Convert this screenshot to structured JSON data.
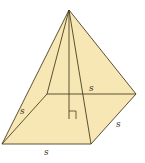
{
  "diagram": {
    "type": "square-pyramid",
    "colors": {
      "fill": "#f7e7b5",
      "stroke": "#4a3e22",
      "background": "#ffffff"
    },
    "vertices": {
      "apex": [
        69,
        10
      ],
      "front_left": [
        2,
        144
      ],
      "front_right": [
        91,
        144
      ],
      "back_right": [
        136,
        94
      ],
      "back_left": [
        47,
        94
      ],
      "base_center": [
        69,
        119
      ]
    },
    "labels": {
      "back_edge": "s",
      "left_edge": "s",
      "right_edge": "s",
      "front_edge": "s"
    },
    "right_angle_marker": true
  }
}
